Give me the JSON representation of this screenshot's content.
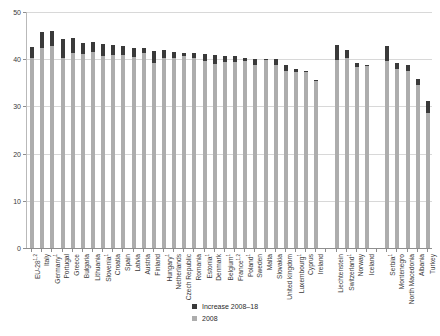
{
  "chart_data": {
    "type": "bar",
    "title": "",
    "subtitle": "",
    "xlabel": "",
    "ylabel": "",
    "ylim": [
      0,
      50
    ],
    "yticks": [
      0,
      10,
      20,
      30,
      40,
      50
    ],
    "grid": true,
    "legend_position": "bottom-right",
    "stacked": true,
    "categories": [
      "EU-28",
      "Italy",
      "Germany",
      "Portugal",
      "Greece",
      "Bulgaria",
      "Lithuania",
      "Slovenia",
      "Croatia",
      "Spain",
      "Latvia",
      "Austria",
      "Finland",
      "Hungary",
      "Netherlands",
      "Czech Republic",
      "Romania",
      "Estonia",
      "Denmark",
      "Belgium",
      "France",
      "Poland",
      "Sweden",
      "Malta",
      "Slovakia",
      "United kingdom",
      "Luxembourg",
      "Cyprus",
      "Ireland",
      "",
      "Liechtenstein",
      "Switzerland",
      "Norway",
      "Iceland",
      "",
      "Serbia",
      "Montenegro",
      "North Macedonia",
      "Albania",
      "Turkey"
    ],
    "category_footnotes": [
      "1,2",
      "",
      "1",
      "",
      "",
      "",
      "",
      "1",
      "",
      "",
      "",
      "",
      "",
      "1",
      "",
      "",
      "",
      "1",
      "",
      "1",
      "1,2",
      "1",
      "",
      "",
      "",
      "",
      "1",
      "",
      "",
      "",
      "",
      "1",
      "",
      "",
      "",
      "1",
      "",
      "",
      "",
      ""
    ],
    "series": [
      {
        "name": "2008",
        "color": "#adadad",
        "values": [
          40.2,
          42.3,
          42.8,
          40.3,
          41.4,
          41.1,
          41.6,
          40.6,
          40.8,
          40.9,
          40.4,
          41.3,
          39.2,
          40.3,
          40.2,
          40.6,
          40.3,
          39.6,
          39.0,
          39.4,
          39.5,
          39.6,
          38.7,
          40.0,
          38.8,
          37.5,
          37.2,
          37.4,
          35.5,
          null,
          39.9,
          40.2,
          38.4,
          38.6,
          null,
          39.7,
          38.0,
          37.4,
          34.6,
          28.6
        ]
      },
      {
        "name": "Increase 2008–18",
        "color": "#3a3a3a",
        "values": [
          2.3,
          3.5,
          3.2,
          4.0,
          3.1,
          2.4,
          2.0,
          2.6,
          2.3,
          1.8,
          2.0,
          1.0,
          2.6,
          1.6,
          1.4,
          0.8,
          1.0,
          1.6,
          1.8,
          1.2,
          1.1,
          0.7,
          1.4,
          0.1,
          1.2,
          1.2,
          0.8,
          0.2,
          0.1,
          null,
          3.1,
          1.8,
          0.9,
          0.1,
          null,
          3.0,
          1.1,
          1.3,
          1.3,
          2.5
        ]
      }
    ],
    "totals": [
      42.5,
      45.8,
      46.0,
      44.3,
      44.5,
      43.5,
      43.6,
      43.2,
      43.1,
      42.7,
      42.4,
      42.3,
      41.8,
      41.9,
      41.6,
      41.4,
      41.3,
      41.2,
      40.8,
      40.6,
      40.6,
      40.3,
      40.1,
      40.1,
      40.0,
      38.7,
      38.0,
      37.6,
      35.6,
      null,
      43.0,
      42.0,
      39.3,
      38.7,
      null,
      42.7,
      39.1,
      38.7,
      35.9,
      31.1
    ]
  },
  "legend": {
    "items": [
      {
        "label": "Increase 2008–18",
        "color": "#3a3a3a"
      },
      {
        "label": "2008",
        "color": "#adadad"
      }
    ]
  },
  "axes": {
    "y": {
      "ticks": [
        "0",
        "10",
        "20",
        "30",
        "40",
        "50"
      ]
    }
  }
}
